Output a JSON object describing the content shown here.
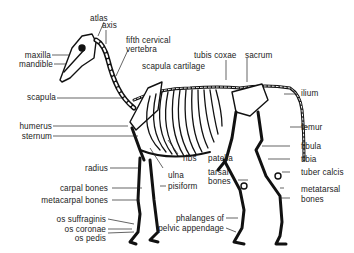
{
  "diagram": {
    "labels": {
      "atlas": "atlas",
      "axis": "axis",
      "fifth_cervical_1": "fifth cervical",
      "fifth_cervical_2": "vertebra",
      "maxilla": "maxilla",
      "mandible": "mandible",
      "scapula_cartilage": "scapula cartilage",
      "tubis_coxae": "tubis coxae",
      "sacrum": "sacrum",
      "ilium": "ilium",
      "scapula": "scapula",
      "humerus": "humerus",
      "sternum": "sternum",
      "femur": "femur",
      "fibula": "fibula",
      "tibia": "tibia",
      "ribs": "ribs",
      "patella": "patella",
      "radius": "radius",
      "ulna": "ulna",
      "tarsal_1": "tarsal",
      "tarsal_2": "bones",
      "tuber_calcis": "tuber calcis",
      "carpal_bones": "carpal bones",
      "pisiform": "pisiform",
      "metacarpal_bones": "metacarpal bones",
      "metatarsal_1": "metatarsal",
      "metatarsal_2": "bones",
      "os_suffraginis": "os suffraginis",
      "os_coronae": "os coronae",
      "os_pedis": "os pedis",
      "phalanges_1": "phalanges of",
      "phalanges_2": "pelvic appendage"
    }
  }
}
